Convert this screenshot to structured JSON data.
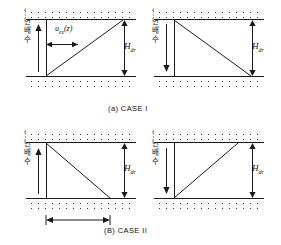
{
  "figure": {
    "type": "geotechnical-consolidation-diagram",
    "background_color": "#ffffff",
    "line_color": "#1a1a1a",
    "width": 281,
    "height": 245
  },
  "captions": {
    "case1": "(a) CASE  I",
    "case2": "(B) CASE  II"
  },
  "labels": {
    "drainage_korean": "일면배수",
    "excess_pore_pressure": "u",
    "excess_pore_pressure_sub": "ex",
    "excess_pore_pressure_arg": "(z)",
    "drainage_height": "H",
    "drainage_height_sub": "dr"
  },
  "panels": [
    {
      "id": "case1-left",
      "caption_group": "(a) CASE  I",
      "korean_label": "일면배수",
      "arrow_direction": "up",
      "pressure_label": "u",
      "pressure_sub": "ex",
      "pressure_arg": "(z)",
      "height_label": "H",
      "height_sub": "dr",
      "distribution": "triangle increasing downward",
      "top_layer": "sand",
      "bottom_layer": "sand"
    },
    {
      "id": "case1-right",
      "caption_group": "(a) CASE  I",
      "korean_label": "일면배수",
      "arrow_direction": "down",
      "height_label": "H",
      "height_sub": "dr",
      "distribution": "triangle decreasing downward",
      "top_layer": "sand",
      "bottom_layer": "sand"
    },
    {
      "id": "case2-left",
      "caption_group": "(B) CASE  II",
      "korean_label": "일면배수",
      "arrow_direction": "up",
      "height_label": "H",
      "height_sub": "dr",
      "distribution": "triangle decreasing downward",
      "has_width_dimension": true,
      "top_layer": "sand",
      "bottom_layer": "sand"
    },
    {
      "id": "case2-right",
      "caption_group": "(B) CASE  II",
      "korean_label": "일면배수",
      "arrow_direction": "down",
      "height_label": "H",
      "height_sub": "dr",
      "distribution": "triangle increasing downward",
      "top_layer": "sand",
      "bottom_layer": "sand"
    }
  ]
}
